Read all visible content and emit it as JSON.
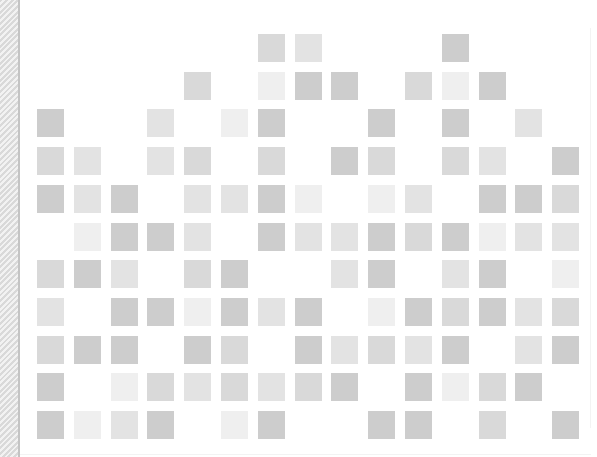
{
  "canvas": {
    "width": 597,
    "height": 457,
    "background": "#ffffff"
  },
  "left_strip": {
    "pattern": "diagonal-hatch",
    "stripe_color": "#d9d9d9",
    "base_color": "#f2f2f2",
    "edge_color": "#c4c4c4"
  },
  "grid": {
    "columns": 15,
    "rows": 11,
    "origin_x": 37,
    "origin_y": 34,
    "pitch_x": 36.8,
    "pitch_y": 37.7,
    "cell_width": 27,
    "cell_height": 28,
    "shades": {
      "0": null,
      "1": "#efefef",
      "2": "#e3e3e3",
      "3": "#d9d9d9",
      "4": "#cdcdcd"
    },
    "matrix": [
      [
        0,
        0,
        0,
        0,
        0,
        0,
        3,
        2,
        0,
        0,
        0,
        4,
        0,
        0,
        0
      ],
      [
        0,
        0,
        0,
        0,
        3,
        0,
        1,
        4,
        4,
        0,
        3,
        1,
        4,
        0,
        0
      ],
      [
        4,
        0,
        0,
        2,
        0,
        1,
        4,
        0,
        0,
        4,
        0,
        4,
        0,
        2,
        0
      ],
      [
        3,
        2,
        0,
        2,
        3,
        0,
        3,
        0,
        4,
        3,
        0,
        3,
        2,
        0,
        4
      ],
      [
        4,
        2,
        4,
        0,
        2,
        2,
        4,
        1,
        0,
        1,
        2,
        0,
        4,
        4,
        3
      ],
      [
        0,
        1,
        4,
        4,
        2,
        0,
        4,
        2,
        2,
        4,
        3,
        4,
        1,
        2,
        2
      ],
      [
        3,
        4,
        2,
        0,
        3,
        4,
        0,
        0,
        2,
        4,
        0,
        2,
        4,
        0,
        1
      ],
      [
        2,
        0,
        4,
        4,
        1,
        4,
        2,
        4,
        0,
        1,
        4,
        3,
        4,
        2,
        3
      ],
      [
        3,
        4,
        4,
        0,
        4,
        3,
        0,
        4,
        2,
        3,
        2,
        4,
        0,
        2,
        4
      ],
      [
        4,
        0,
        1,
        3,
        2,
        3,
        2,
        3,
        4,
        0,
        4,
        1,
        3,
        4,
        0
      ],
      [
        4,
        1,
        2,
        4,
        0,
        1,
        4,
        0,
        0,
        4,
        4,
        0,
        3,
        0,
        4
      ]
    ]
  }
}
